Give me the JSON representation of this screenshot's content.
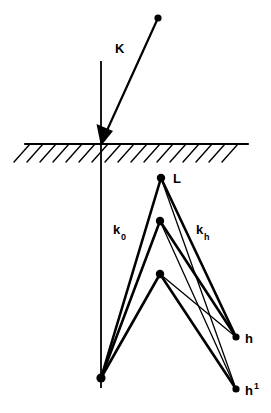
{
  "figure": {
    "title": "",
    "type": "diagram",
    "background_color": "#ffffff",
    "stroke_color": "#000000",
    "width": 271,
    "height": 413,
    "labels": {
      "incident_beam": "K",
      "internal_beam_0": "k",
      "internal_beam_0_sub": "0",
      "internal_beam_h": "k",
      "internal_beam_h_sub": "h",
      "top_vertex": "L",
      "exit_point_h": "h",
      "exit_point_h_prime": "h",
      "exit_point_h_prime_sup": "1"
    },
    "geometry": {
      "surface_line": {
        "x1": 25,
        "y1": 144,
        "x2": 248,
        "y2": 144
      },
      "hatching": {
        "count": 17,
        "start_x": 30,
        "spacing": 13,
        "dx": -16,
        "dy": 18
      },
      "normal_line": {
        "x1": 101,
        "y1": 61,
        "x2": 101,
        "y2": 388
      },
      "incident_arrow": {
        "x1": 158,
        "y1": 18,
        "x2": 101,
        "y2": 144
      },
      "incident_source_dot": {
        "cx": 158,
        "cy": 18,
        "r": 3.6
      },
      "nodes": [
        {
          "name": "vertex-L",
          "cx": 161,
          "cy": 178,
          "r": 4.2
        },
        {
          "name": "vertex-mid",
          "cx": 160,
          "cy": 221,
          "r": 4.2
        },
        {
          "name": "vertex-low",
          "cx": 160,
          "cy": 274,
          "r": 4.2
        },
        {
          "name": "origin-bottom",
          "cx": 101,
          "cy": 378,
          "r": 4.6
        },
        {
          "name": "exit-h",
          "cx": 236,
          "cy": 337,
          "r": 3.6
        },
        {
          "name": "exit-h-prime",
          "cx": 236,
          "cy": 389,
          "r": 3.6
        }
      ],
      "rays": [
        {
          "name": "ray-origin-to-L",
          "x1": 101,
          "y1": 378,
          "x2": 161,
          "y2": 178,
          "w": 2.6
        },
        {
          "name": "ray-origin-to-mid",
          "x1": 101,
          "y1": 378,
          "x2": 160,
          "y2": 221,
          "w": 2.6
        },
        {
          "name": "ray-origin-to-low",
          "x1": 101,
          "y1": 378,
          "x2": 160,
          "y2": 274,
          "w": 2.6
        },
        {
          "name": "ray-L-to-h",
          "x1": 161,
          "y1": 178,
          "x2": 236,
          "y2": 337,
          "w": 2.6
        },
        {
          "name": "ray-L-to-hprime",
          "x1": 161,
          "y1": 178,
          "x2": 236,
          "y2": 389,
          "w": 1.3
        },
        {
          "name": "ray-mid-to-h",
          "x1": 160,
          "y1": 221,
          "x2": 236,
          "y2": 337,
          "w": 2.6
        },
        {
          "name": "ray-mid-to-hprime",
          "x1": 160,
          "y1": 221,
          "x2": 236,
          "y2": 389,
          "w": 1.3
        },
        {
          "name": "ray-low-to-h",
          "x1": 160,
          "y1": 274,
          "x2": 236,
          "y2": 337,
          "w": 1.3
        },
        {
          "name": "ray-low-to-hprime",
          "x1": 160,
          "y1": 274,
          "x2": 236,
          "y2": 389,
          "w": 2.6
        }
      ],
      "label_positions": {
        "K": {
          "x": 115,
          "y": 53
        },
        "L": {
          "x": 173,
          "y": 183
        },
        "k0": {
          "x": 113,
          "y": 234
        },
        "kh": {
          "x": 196,
          "y": 234
        },
        "h": {
          "x": 245,
          "y": 343
        },
        "h1": {
          "x": 245,
          "y": 395
        }
      }
    }
  }
}
